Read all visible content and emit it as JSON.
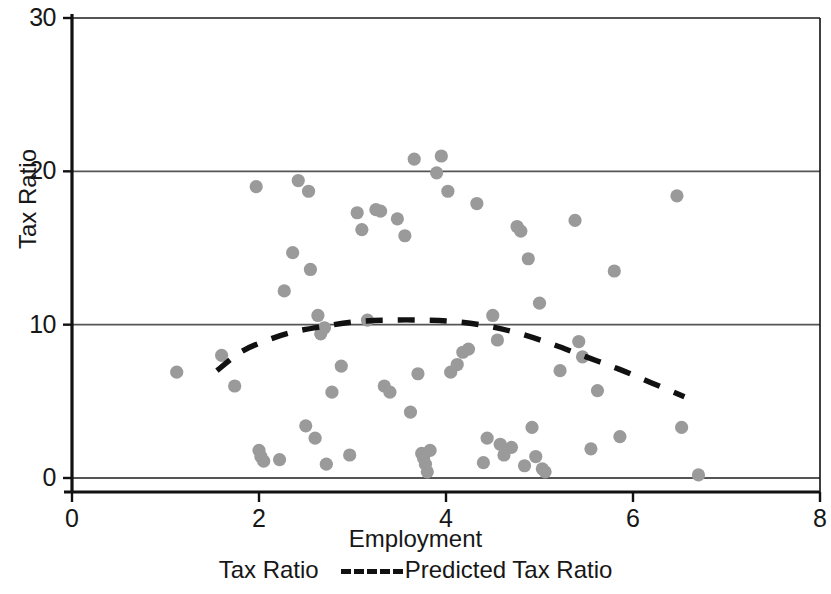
{
  "chart_data": {
    "type": "scatter",
    "title": "",
    "xlabel": "Employment",
    "ylabel": "Tax Ratio",
    "xlim": [
      0,
      8
    ],
    "ylim": [
      0,
      30
    ],
    "xticks": [
      0,
      2,
      4,
      6,
      8
    ],
    "yticks": [
      0,
      10,
      20,
      30
    ],
    "xtick_labels": [
      "0",
      "2",
      "4",
      "6",
      "8"
    ],
    "ytick_labels": [
      "0",
      "10",
      "20",
      "30"
    ],
    "grid": "horizontal",
    "legend_position": "bottom",
    "point_color": "#9a9a9a",
    "line_color": "#111111",
    "axis_color": "#111111",
    "grid_color": "#555555",
    "series": [
      {
        "name": "Tax Ratio",
        "type": "scatter",
        "marker": "circle",
        "points": [
          [
            1.12,
            6.9
          ],
          [
            1.6,
            8.0
          ],
          [
            1.74,
            6.0
          ],
          [
            1.97,
            19.0
          ],
          [
            2.0,
            1.8
          ],
          [
            2.02,
            1.4
          ],
          [
            2.05,
            1.1
          ],
          [
            2.22,
            1.2
          ],
          [
            2.27,
            12.2
          ],
          [
            2.36,
            14.7
          ],
          [
            2.42,
            19.4
          ],
          [
            2.5,
            3.4
          ],
          [
            2.53,
            18.7
          ],
          [
            2.55,
            13.6
          ],
          [
            2.6,
            2.6
          ],
          [
            2.63,
            10.6
          ],
          [
            2.66,
            9.4
          ],
          [
            2.7,
            9.8
          ],
          [
            2.72,
            0.9
          ],
          [
            2.78,
            5.6
          ],
          [
            2.88,
            7.3
          ],
          [
            2.97,
            1.5
          ],
          [
            3.05,
            17.3
          ],
          [
            3.1,
            16.2
          ],
          [
            3.16,
            10.3
          ],
          [
            3.25,
            17.5
          ],
          [
            3.3,
            17.4
          ],
          [
            3.34,
            6.0
          ],
          [
            3.4,
            5.6
          ],
          [
            3.48,
            16.9
          ],
          [
            3.56,
            15.8
          ],
          [
            3.62,
            4.3
          ],
          [
            3.66,
            20.8
          ],
          [
            3.7,
            6.8
          ],
          [
            3.74,
            1.6
          ],
          [
            3.76,
            1.3
          ],
          [
            3.78,
            0.9
          ],
          [
            3.8,
            0.4
          ],
          [
            3.83,
            1.8
          ],
          [
            3.9,
            19.9
          ],
          [
            3.95,
            21.0
          ],
          [
            4.02,
            18.7
          ],
          [
            4.05,
            6.9
          ],
          [
            4.12,
            7.4
          ],
          [
            4.18,
            8.2
          ],
          [
            4.24,
            8.4
          ],
          [
            4.33,
            17.9
          ],
          [
            4.4,
            1.0
          ],
          [
            4.44,
            2.6
          ],
          [
            4.5,
            10.6
          ],
          [
            4.55,
            9.0
          ],
          [
            4.58,
            2.2
          ],
          [
            4.62,
            1.5
          ],
          [
            4.7,
            2.0
          ],
          [
            4.76,
            16.4
          ],
          [
            4.8,
            16.1
          ],
          [
            4.84,
            0.8
          ],
          [
            4.88,
            14.3
          ],
          [
            4.92,
            3.3
          ],
          [
            4.96,
            1.4
          ],
          [
            5.0,
            11.4
          ],
          [
            5.03,
            0.6
          ],
          [
            5.06,
            0.4
          ],
          [
            5.22,
            7.0
          ],
          [
            5.38,
            16.8
          ],
          [
            5.42,
            8.9
          ],
          [
            5.46,
            7.9
          ],
          [
            5.55,
            1.9
          ],
          [
            5.62,
            5.7
          ],
          [
            5.8,
            13.5
          ],
          [
            5.86,
            2.7
          ],
          [
            6.47,
            18.4
          ],
          [
            6.52,
            3.3
          ],
          [
            6.7,
            0.2
          ]
        ]
      },
      {
        "name": "Predicted Tax Ratio",
        "type": "line",
        "style": "dashed",
        "points": [
          [
            1.55,
            7.0
          ],
          [
            1.8,
            8.2
          ],
          [
            2.05,
            8.9
          ],
          [
            2.35,
            9.5
          ],
          [
            2.7,
            9.9
          ],
          [
            3.05,
            10.2
          ],
          [
            3.4,
            10.3
          ],
          [
            3.75,
            10.3
          ],
          [
            4.1,
            10.2
          ],
          [
            4.45,
            9.9
          ],
          [
            4.8,
            9.4
          ],
          [
            5.15,
            8.7
          ],
          [
            5.5,
            7.9
          ],
          [
            5.85,
            7.1
          ],
          [
            6.2,
            6.2
          ],
          [
            6.55,
            5.3
          ]
        ]
      }
    ]
  },
  "legend": {
    "scatter_label": "Tax Ratio",
    "line_label": "Predicted Tax Ratio"
  },
  "axes": {
    "xlabel": "Employment",
    "ylabel": "Tax Ratio"
  }
}
